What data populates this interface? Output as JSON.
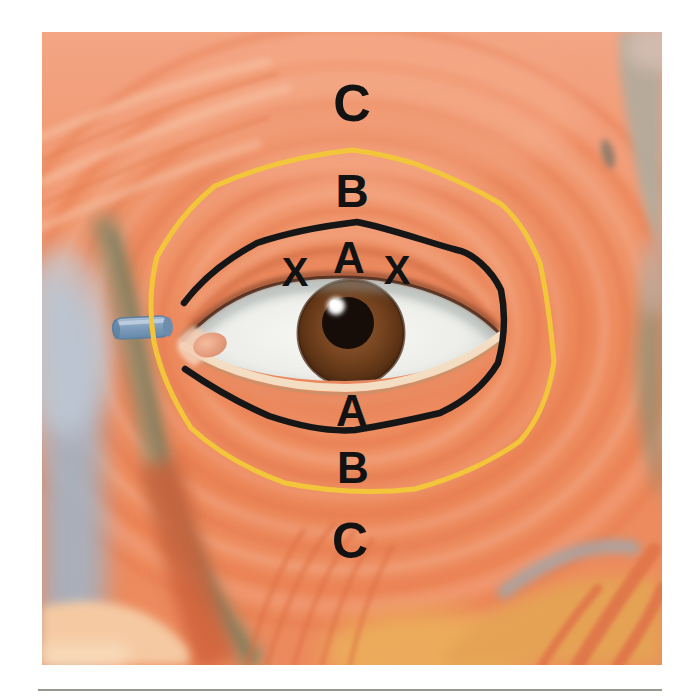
{
  "figure": {
    "labels": {
      "top_c": "C",
      "top_b": "B",
      "top_a": "A",
      "x_left": "X",
      "x_right": "X",
      "bottom_a": "A",
      "bottom_b": "B",
      "bottom_c": "C"
    },
    "annotation_colors": {
      "inner_outline_black": "#161616",
      "outer_outline_yellow": "#F2C53A",
      "label_text": "#121212"
    },
    "artwork_colors": {
      "muscle_orange": "#ED8A5C",
      "muscle_highlight": "#F6B494",
      "muscle_shadow": "#E0714B",
      "tendon_blue": "#7E9CBB",
      "iris_brown": "#7B4A26",
      "pupil_black": "#160D08",
      "sclera_white": "#F2F2EF",
      "caruncle_pink": "#EFA98C",
      "lid_margin_cream": "#F3DEC4"
    }
  }
}
